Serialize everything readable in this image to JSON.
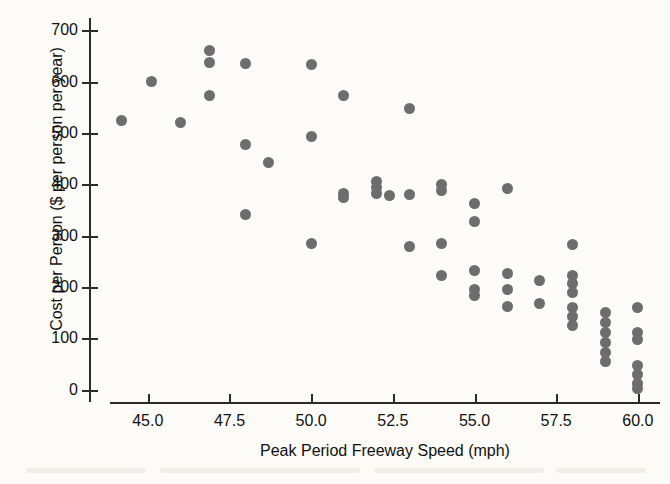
{
  "chart_data": {
    "type": "scatter",
    "title": "",
    "xlabel": "Peak Period Freeway Speed (mph)",
    "ylabel": "Cost per Person ($ per person per year)",
    "xlim": [
      43.2,
      60.8
    ],
    "ylim": [
      -20,
      720
    ],
    "xticks": [
      "45.0",
      "47.5",
      "50.0",
      "52.5",
      "55.0",
      "57.5",
      "60.0"
    ],
    "xtick_values": [
      45.0,
      47.5,
      50.0,
      52.5,
      55.0,
      57.5,
      60.0
    ],
    "yticks": [
      "0",
      "100",
      "200",
      "300",
      "400",
      "500",
      "600",
      "700"
    ],
    "ytick_values": [
      0,
      100,
      200,
      300,
      400,
      500,
      600,
      700
    ],
    "grid": false,
    "legend": "none",
    "marker": "filled-circle",
    "marker_color": "#6d6d6d",
    "background_color": "#fcfbf8",
    "axis_color": "#2b2b2b",
    "n_points": 56,
    "points": [
      {
        "x": 44.2,
        "y": 525
      },
      {
        "x": 45.1,
        "y": 600
      },
      {
        "x": 46.0,
        "y": 520
      },
      {
        "x": 46.9,
        "y": 660
      },
      {
        "x": 46.9,
        "y": 638
      },
      {
        "x": 46.9,
        "y": 573
      },
      {
        "x": 48.0,
        "y": 635
      },
      {
        "x": 48.0,
        "y": 478
      },
      {
        "x": 48.0,
        "y": 342
      },
      {
        "x": 48.7,
        "y": 443
      },
      {
        "x": 50.0,
        "y": 633
      },
      {
        "x": 50.0,
        "y": 493
      },
      {
        "x": 50.0,
        "y": 285
      },
      {
        "x": 51.0,
        "y": 573
      },
      {
        "x": 51.0,
        "y": 383
      },
      {
        "x": 51.0,
        "y": 375
      },
      {
        "x": 52.0,
        "y": 405
      },
      {
        "x": 52.0,
        "y": 393
      },
      {
        "x": 52.0,
        "y": 382
      },
      {
        "x": 52.4,
        "y": 378
      },
      {
        "x": 53.0,
        "y": 547
      },
      {
        "x": 53.0,
        "y": 380
      },
      {
        "x": 53.0,
        "y": 278
      },
      {
        "x": 54.0,
        "y": 400
      },
      {
        "x": 54.0,
        "y": 388
      },
      {
        "x": 54.0,
        "y": 285
      },
      {
        "x": 54.0,
        "y": 223
      },
      {
        "x": 55.0,
        "y": 362
      },
      {
        "x": 55.0,
        "y": 327
      },
      {
        "x": 55.0,
        "y": 232
      },
      {
        "x": 55.0,
        "y": 196
      },
      {
        "x": 55.0,
        "y": 184
      },
      {
        "x": 56.0,
        "y": 392
      },
      {
        "x": 56.0,
        "y": 227
      },
      {
        "x": 56.0,
        "y": 196
      },
      {
        "x": 56.0,
        "y": 163
      },
      {
        "x": 57.0,
        "y": 212
      },
      {
        "x": 57.0,
        "y": 168
      },
      {
        "x": 58.0,
        "y": 282
      },
      {
        "x": 58.0,
        "y": 223
      },
      {
        "x": 58.0,
        "y": 206
      },
      {
        "x": 58.0,
        "y": 190
      },
      {
        "x": 58.0,
        "y": 160
      },
      {
        "x": 58.0,
        "y": 142
      },
      {
        "x": 58.0,
        "y": 126
      },
      {
        "x": 59.0,
        "y": 150
      },
      {
        "x": 59.0,
        "y": 130
      },
      {
        "x": 59.0,
        "y": 112
      },
      {
        "x": 59.0,
        "y": 92
      },
      {
        "x": 59.0,
        "y": 72
      },
      {
        "x": 59.0,
        "y": 55
      },
      {
        "x": 60.0,
        "y": 160
      },
      {
        "x": 60.0,
        "y": 112
      },
      {
        "x": 60.0,
        "y": 98
      },
      {
        "x": 60.0,
        "y": 48
      },
      {
        "x": 60.0,
        "y": 30
      },
      {
        "x": 60.0,
        "y": 12
      },
      {
        "x": 60.0,
        "y": 2
      }
    ]
  }
}
